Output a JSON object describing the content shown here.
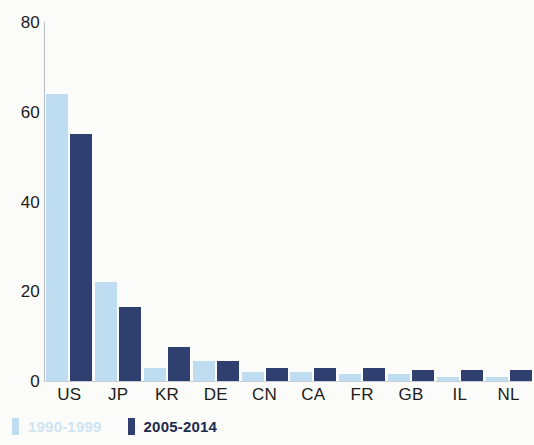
{
  "chart_data": {
    "type": "bar",
    "title": "",
    "subtitle": "",
    "xlabel": "",
    "ylabel": "",
    "ylim": [
      0,
      80
    ],
    "yticks": [
      0,
      20,
      40,
      60,
      80
    ],
    "grid": false,
    "legend_position": "bottom-left",
    "categories": [
      "US",
      "JP",
      "KR",
      "DE",
      "CN",
      "CA",
      "FR",
      "GB",
      "IL",
      "NL"
    ],
    "series": [
      {
        "name": "1990-1999",
        "color": "#bfddf0",
        "values": [
          64,
          22,
          3,
          4.5,
          2,
          2,
          1.5,
          1.5,
          1,
          1
        ]
      },
      {
        "name": "2005-2014",
        "color": "#2f4070",
        "values": [
          55,
          16.5,
          7.5,
          4.5,
          3,
          3,
          3,
          2.5,
          2.5,
          2.5
        ]
      }
    ]
  },
  "axis": {
    "y_tick_labels": [
      "80",
      "60",
      "40",
      "20",
      "0"
    ]
  },
  "legend": {
    "items": [
      {
        "label": "1990-1999",
        "swatch": "legend-swatch-light"
      },
      {
        "label": "2005-2014",
        "swatch": "legend-swatch-dark"
      }
    ]
  }
}
